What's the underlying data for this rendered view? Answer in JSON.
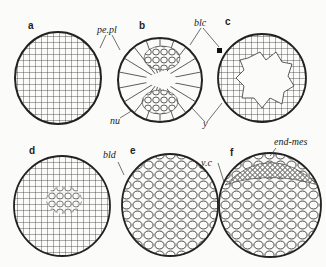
{
  "figure": {
    "panels": [
      {
        "id": "a",
        "label": "a"
      },
      {
        "id": "b",
        "label": "b"
      },
      {
        "id": "c",
        "label": "c"
      },
      {
        "id": "d",
        "label": "d"
      },
      {
        "id": "e",
        "label": "e"
      },
      {
        "id": "f",
        "label": "f"
      }
    ],
    "annotations": {
      "pe_pl": "pe.pl",
      "blc": "blc",
      "nu": "nu",
      "y": "y",
      "bld": "bld",
      "y_c": "y.c",
      "end_mes": "end-mes"
    }
  }
}
